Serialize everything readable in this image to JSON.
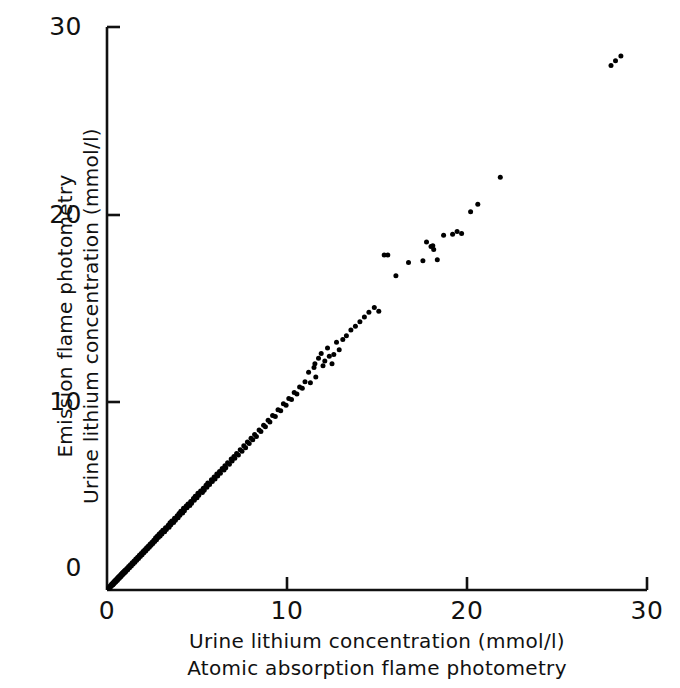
{
  "figure": {
    "background_color": "#ffffff",
    "ink_color": "#111111"
  },
  "axes": {
    "y_title_line1": "Emission flame photometry",
    "y_title_line2": "Urine lithium concentration (mmol/l)",
    "x_title_line1": "Urine lithium concentration (mmol/l)",
    "x_title_line2": "Atomic absorption flame photometry",
    "y_ticks": [
      "0",
      "10",
      "20",
      "30"
    ],
    "x_ticks": [
      "0",
      "10",
      "20",
      "30"
    ]
  },
  "chart_data": {
    "type": "scatter",
    "title": "",
    "xlabel": "Urine lithium concentration (mmol/l) — Atomic absorption flame photometry",
    "ylabel": "Urine lithium concentration (mmol/l) — Emission flame photometry",
    "xlim": [
      0,
      30
    ],
    "ylim": [
      0,
      30
    ],
    "xticks": [
      0,
      10,
      20,
      30
    ],
    "yticks": [
      0,
      10,
      20,
      30
    ],
    "grid": false,
    "legend": null,
    "marker": "filled-circle",
    "marker_color": "#000000",
    "marker_size_px": 5,
    "n_points": 204,
    "relationship": "near 1:1 identity agreement between the two assay methods",
    "points": [
      [
        0.1,
        0.12
      ],
      [
        0.15,
        0.1
      ],
      [
        0.18,
        0.22
      ],
      [
        0.22,
        0.18
      ],
      [
        0.25,
        0.3
      ],
      [
        0.28,
        0.25
      ],
      [
        0.3,
        0.35
      ],
      [
        0.33,
        0.28
      ],
      [
        0.35,
        0.4
      ],
      [
        0.38,
        0.33
      ],
      [
        0.4,
        0.45
      ],
      [
        0.42,
        0.38
      ],
      [
        0.45,
        0.5
      ],
      [
        0.48,
        0.42
      ],
      [
        0.5,
        0.55
      ],
      [
        0.52,
        0.48
      ],
      [
        0.55,
        0.6
      ],
      [
        0.58,
        0.52
      ],
      [
        0.6,
        0.65
      ],
      [
        0.62,
        0.58
      ],
      [
        0.65,
        0.7
      ],
      [
        0.68,
        0.62
      ],
      [
        0.7,
        0.75
      ],
      [
        0.72,
        0.68
      ],
      [
        0.75,
        0.8
      ],
      [
        0.78,
        0.72
      ],
      [
        0.8,
        0.85
      ],
      [
        0.82,
        0.78
      ],
      [
        0.85,
        0.9
      ],
      [
        0.88,
        0.82
      ],
      [
        0.9,
        0.95
      ],
      [
        0.92,
        0.88
      ],
      [
        0.95,
        1.0
      ],
      [
        0.98,
        0.92
      ],
      [
        1.0,
        1.05
      ],
      [
        1.05,
        0.98
      ],
      [
        1.1,
        1.15
      ],
      [
        1.15,
        1.08
      ],
      [
        1.2,
        1.25
      ],
      [
        1.25,
        1.18
      ],
      [
        1.3,
        1.35
      ],
      [
        1.35,
        1.28
      ],
      [
        1.4,
        1.45
      ],
      [
        1.45,
        1.38
      ],
      [
        1.5,
        1.55
      ],
      [
        1.55,
        1.48
      ],
      [
        1.6,
        1.65
      ],
      [
        1.65,
        1.58
      ],
      [
        1.7,
        1.75
      ],
      [
        1.75,
        1.68
      ],
      [
        1.8,
        1.85
      ],
      [
        1.85,
        1.78
      ],
      [
        1.9,
        1.95
      ],
      [
        1.95,
        1.88
      ],
      [
        2.0,
        2.05
      ],
      [
        2.05,
        1.98
      ],
      [
        2.1,
        2.15
      ],
      [
        2.15,
        2.08
      ],
      [
        2.2,
        2.25
      ],
      [
        2.25,
        2.18
      ],
      [
        2.3,
        2.35
      ],
      [
        2.35,
        2.28
      ],
      [
        2.4,
        2.45
      ],
      [
        2.45,
        2.38
      ],
      [
        2.5,
        2.55
      ],
      [
        2.55,
        2.48
      ],
      [
        2.6,
        2.65
      ],
      [
        2.65,
        2.58
      ],
      [
        2.7,
        2.78
      ],
      [
        2.75,
        2.68
      ],
      [
        2.8,
        2.88
      ],
      [
        2.85,
        2.8
      ],
      [
        2.9,
        2.98
      ],
      [
        2.95,
        2.88
      ],
      [
        3.0,
        3.08
      ],
      [
        3.05,
        2.98
      ],
      [
        3.1,
        3.18
      ],
      [
        3.2,
        3.1
      ],
      [
        3.25,
        3.32
      ],
      [
        3.3,
        3.22
      ],
      [
        3.4,
        3.45
      ],
      [
        3.45,
        3.35
      ],
      [
        3.5,
        3.58
      ],
      [
        3.55,
        3.48
      ],
      [
        3.6,
        3.68
      ],
      [
        3.7,
        3.6
      ],
      [
        3.75,
        3.82
      ],
      [
        3.8,
        3.72
      ],
      [
        3.9,
        3.95
      ],
      [
        3.95,
        3.85
      ],
      [
        4.0,
        4.08
      ],
      [
        4.05,
        3.98
      ],
      [
        4.1,
        4.2
      ],
      [
        4.2,
        4.1
      ],
      [
        4.25,
        4.35
      ],
      [
        4.3,
        4.22
      ],
      [
        4.4,
        4.48
      ],
      [
        4.45,
        4.38
      ],
      [
        4.5,
        4.58
      ],
      [
        4.6,
        4.5
      ],
      [
        4.65,
        4.72
      ],
      [
        4.7,
        4.62
      ],
      [
        4.8,
        4.88
      ],
      [
        4.85,
        4.78
      ],
      [
        4.9,
        5.0
      ],
      [
        5.0,
        4.92
      ],
      [
        5.05,
        5.15
      ],
      [
        5.1,
        5.05
      ],
      [
        5.2,
        5.28
      ],
      [
        5.3,
        5.2
      ],
      [
        5.35,
        5.42
      ],
      [
        5.4,
        5.32
      ],
      [
        5.5,
        5.58
      ],
      [
        5.55,
        5.48
      ],
      [
        5.6,
        5.7
      ],
      [
        5.7,
        5.62
      ],
      [
        5.8,
        5.88
      ],
      [
        5.85,
        5.78
      ],
      [
        5.95,
        6.02
      ],
      [
        6.0,
        5.92
      ],
      [
        6.1,
        6.18
      ],
      [
        6.15,
        6.08
      ],
      [
        6.25,
        6.32
      ],
      [
        6.3,
        6.22
      ],
      [
        6.4,
        6.48
      ],
      [
        6.5,
        6.4
      ],
      [
        6.55,
        6.62
      ],
      [
        6.6,
        6.52
      ],
      [
        6.7,
        6.78
      ],
      [
        6.8,
        6.7
      ],
      [
        6.9,
        6.98
      ],
      [
        6.95,
        6.88
      ],
      [
        7.05,
        7.12
      ],
      [
        7.1,
        7.02
      ],
      [
        7.2,
        7.28
      ],
      [
        7.3,
        7.2
      ],
      [
        7.4,
        7.48
      ],
      [
        7.5,
        7.4
      ],
      [
        7.6,
        7.68
      ],
      [
        7.7,
        7.58
      ],
      [
        7.8,
        7.88
      ],
      [
        7.9,
        7.8
      ],
      [
        8.0,
        8.08
      ],
      [
        8.1,
        8.0
      ],
      [
        8.2,
        8.28
      ],
      [
        8.3,
        8.18
      ],
      [
        8.45,
        8.52
      ],
      [
        8.55,
        8.45
      ],
      [
        8.7,
        8.78
      ],
      [
        8.8,
        8.7
      ],
      [
        8.95,
        9.05
      ],
      [
        9.05,
        8.95
      ],
      [
        9.2,
        9.3
      ],
      [
        9.35,
        9.25
      ],
      [
        9.5,
        9.6
      ],
      [
        9.65,
        9.55
      ],
      [
        9.8,
        9.92
      ],
      [
        9.95,
        9.85
      ],
      [
        10.1,
        10.2
      ],
      [
        10.25,
        10.15
      ],
      [
        10.4,
        10.52
      ],
      [
        10.55,
        10.45
      ],
      [
        10.7,
        10.82
      ],
      [
        10.85,
        10.75
      ],
      [
        11.0,
        11.1
      ],
      [
        11.2,
        11.6
      ],
      [
        11.3,
        11.05
      ],
      [
        11.5,
        11.85
      ],
      [
        11.55,
        12.05
      ],
      [
        11.6,
        11.35
      ],
      [
        11.75,
        12.35
      ],
      [
        11.9,
        12.6
      ],
      [
        12.0,
        11.95
      ],
      [
        12.1,
        12.2
      ],
      [
        12.25,
        12.9
      ],
      [
        12.35,
        12.45
      ],
      [
        12.5,
        12.05
      ],
      [
        12.6,
        12.55
      ],
      [
        12.75,
        13.2
      ],
      [
        12.9,
        12.8
      ],
      [
        13.1,
        13.35
      ],
      [
        13.3,
        13.55
      ],
      [
        13.55,
        13.85
      ],
      [
        13.8,
        14.05
      ],
      [
        14.05,
        14.3
      ],
      [
        14.3,
        14.55
      ],
      [
        14.55,
        14.8
      ],
      [
        14.85,
        15.05
      ],
      [
        15.1,
        14.85
      ],
      [
        15.4,
        17.85
      ],
      [
        15.6,
        17.85
      ],
      [
        16.05,
        16.75
      ],
      [
        16.75,
        17.45
      ],
      [
        17.55,
        17.55
      ],
      [
        17.75,
        18.55
      ],
      [
        18.0,
        18.3
      ],
      [
        18.1,
        18.35
      ],
      [
        18.15,
        18.15
      ],
      [
        18.35,
        17.6
      ],
      [
        18.7,
        18.9
      ],
      [
        19.2,
        18.95
      ],
      [
        19.45,
        19.1
      ],
      [
        19.7,
        19.0
      ],
      [
        20.2,
        20.15
      ],
      [
        20.6,
        20.55
      ],
      [
        21.85,
        22.0
      ],
      [
        28.0,
        27.95
      ],
      [
        28.25,
        28.2
      ],
      [
        28.55,
        28.45
      ]
    ]
  }
}
